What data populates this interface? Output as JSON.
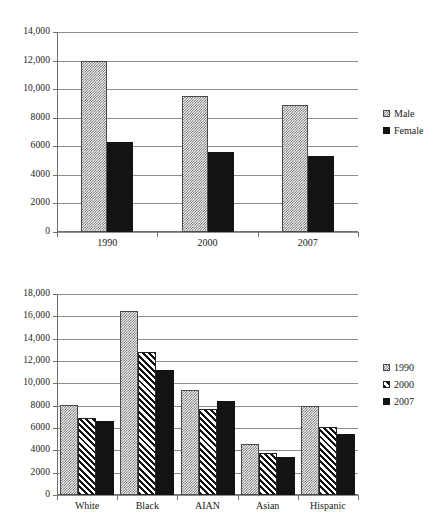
{
  "chart_data": [
    {
      "id": "chart-gender",
      "type": "bar",
      "title": "",
      "xlabel": "",
      "ylabel": "",
      "categories": [
        "1990",
        "2000",
        "2007"
      ],
      "series": [
        {
          "name": "Male",
          "pattern": "checker",
          "values": [
            12000,
            9500,
            8900
          ]
        },
        {
          "name": "Female",
          "pattern": "solid",
          "values": [
            6300,
            5600,
            5300
          ]
        }
      ],
      "ylim": [
        0,
        14000
      ],
      "yticks": [
        0,
        2000,
        4000,
        6000,
        8000,
        10000,
        12000,
        14000
      ],
      "ytick_labels": [
        "0",
        "2000",
        "4000",
        "6000",
        "8000",
        "10,000",
        "12,000",
        "14,000"
      ],
      "grid": true,
      "legend_position": "right"
    },
    {
      "id": "chart-race",
      "type": "bar",
      "title": "",
      "xlabel": "",
      "ylabel": "",
      "categories": [
        "White",
        "Black",
        "AIAN",
        "Asian",
        "Hispanic"
      ],
      "series": [
        {
          "name": "1990",
          "pattern": "checker",
          "values": [
            8100,
            16500,
            9400,
            4600,
            7950
          ]
        },
        {
          "name": "2000",
          "pattern": "hatch",
          "values": [
            6900,
            12800,
            7700,
            3750,
            6050
          ]
        },
        {
          "name": "2007",
          "pattern": "solid",
          "values": [
            6650,
            11200,
            8400,
            3400,
            5500
          ]
        }
      ],
      "ylim": [
        0,
        18000
      ],
      "yticks": [
        0,
        2000,
        4000,
        6000,
        8000,
        10000,
        12000,
        14000,
        16000,
        18000
      ],
      "ytick_labels": [
        "0",
        "2000",
        "4000",
        "6000",
        "8000",
        "10,000",
        "12,000",
        "14,000",
        "16,000",
        "18,000"
      ],
      "grid": true,
      "legend_position": "right"
    }
  ],
  "colors": {
    "gridline": "#8d8d8d",
    "axis": "#6f6f6f",
    "solid_bar": "#131313",
    "pattern_bar": "#5a5a5a",
    "text": "#1a1a1a",
    "background": "#ffffff"
  }
}
